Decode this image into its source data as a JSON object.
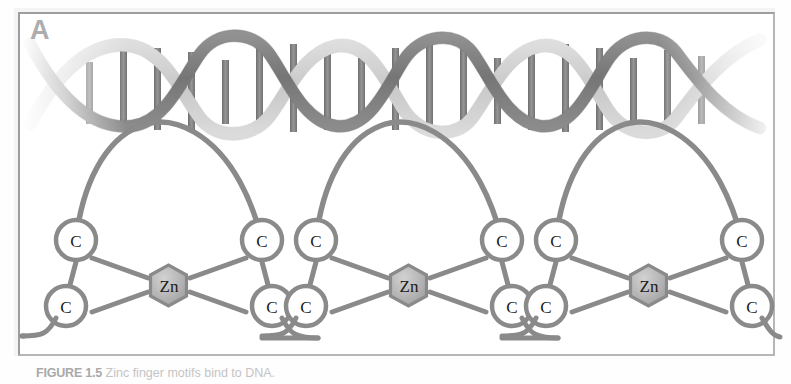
{
  "figure": {
    "panel_label": "A",
    "caption_title": "FIGURE 1.5",
    "caption_body": "Zinc finger motifs bind to DNA.",
    "background_color": "#fefefe",
    "frame_color": "#a8a8a8"
  },
  "dna": {
    "name": "DNA double helix",
    "strand_dark_color": "#8e8e8e",
    "strand_light_color": "#ededed",
    "rung_color": "#7d7d7d",
    "num_base_pair_rungs": 14,
    "faded_ends": "both"
  },
  "zinc_fingers": {
    "count": 3,
    "node_label": "C",
    "metal_label": "Zn",
    "node_fill": "#ffffff",
    "node_stroke": "#8a8a8a",
    "metal_fill": "#b4b4b4",
    "metal_stroke": "#8a8a8a",
    "bond_color": "#8a8a8a",
    "units": [
      {
        "index": 1,
        "center_x": 170,
        "nodes": [
          {
            "position": "upper-left",
            "label": "C"
          },
          {
            "position": "upper-right",
            "label": "C"
          },
          {
            "position": "lower-left",
            "label": "C"
          },
          {
            "position": "lower-right",
            "label": "C"
          }
        ],
        "metal": {
          "label": "Zn"
        }
      },
      {
        "index": 2,
        "center_x": 410,
        "nodes": [
          {
            "position": "upper-left",
            "label": "C"
          },
          {
            "position": "upper-right",
            "label": "C"
          },
          {
            "position": "lower-left",
            "label": "C"
          },
          {
            "position": "lower-right",
            "label": "C"
          }
        ],
        "metal": {
          "label": "Zn"
        }
      },
      {
        "index": 3,
        "center_x": 650,
        "nodes": [
          {
            "position": "upper-left",
            "label": "C"
          },
          {
            "position": "upper-right",
            "label": "C"
          },
          {
            "position": "lower-left",
            "label": "C"
          },
          {
            "position": "lower-right",
            "label": "C"
          }
        ],
        "metal": {
          "label": "Zn"
        }
      }
    ]
  }
}
